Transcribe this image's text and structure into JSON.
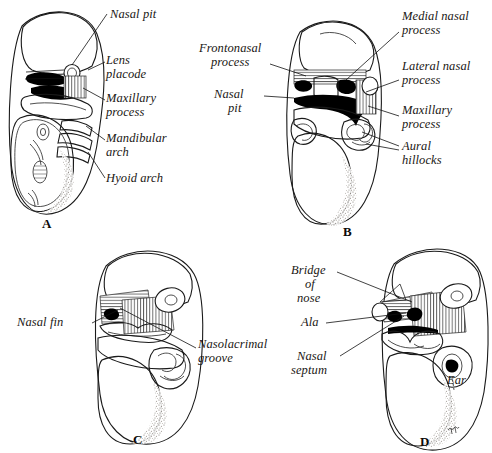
{
  "figure": {
    "panels": [
      {
        "id": "A",
        "letter": "A",
        "labels": [
          {
            "name": "nasal-pit",
            "text": "Nasal pit"
          },
          {
            "name": "lens-placode",
            "text": "Lens\nplacode"
          },
          {
            "name": "maxillary-process",
            "text": "Maxillary\nprocess"
          },
          {
            "name": "mandibular-arch",
            "text": "Mandibular\narch"
          },
          {
            "name": "hyoid-arch",
            "text": "Hyoid arch"
          }
        ]
      },
      {
        "id": "B",
        "letter": "B",
        "labels": [
          {
            "name": "frontonasal-process",
            "text": "Frontonasal\n  process"
          },
          {
            "name": "nasal-pit",
            "text": "Nasal\n  pit"
          },
          {
            "name": "medial-nasal-process",
            "text": "Medial nasal\nprocess"
          },
          {
            "name": "lateral-nasal-process",
            "text": "Lateral nasal\nprocess"
          },
          {
            "name": "maxillary-process",
            "text": "Maxillary\nprocess"
          },
          {
            "name": "aural-hillocks",
            "text": "Aural\nhillocks"
          }
        ]
      },
      {
        "id": "C",
        "letter": "C",
        "labels": [
          {
            "name": "nasal-fin",
            "text": "Nasal fin"
          },
          {
            "name": "nasolacrimal-groove",
            "text": "Nasolacrimal\ngroove"
          }
        ]
      },
      {
        "id": "D",
        "letter": "D",
        "labels": [
          {
            "name": "bridge-of-nose",
            "text": "Bridge\n   of\n nose"
          },
          {
            "name": "ala",
            "text": "Ala"
          },
          {
            "name": "nasal-septum",
            "text": "Nasal\nseptum"
          },
          {
            "name": "ear",
            "text": "Ear"
          }
        ]
      }
    ]
  },
  "labels": {
    "a_nasal_pit": "Nasal pit",
    "a_lens_placode_1": "Lens",
    "a_lens_placode_2": "placode",
    "a_maxillary_1": "Maxillary",
    "a_maxillary_2": "process",
    "a_mandibular_1": "Mandibular",
    "a_mandibular_2": "arch",
    "a_hyoid": "Hyoid arch",
    "a_letter": "A",
    "b_frontonasal_1": "Frontonasal",
    "b_frontonasal_2": "process",
    "b_nasal_1": "Nasal",
    "b_nasal_2": "pit",
    "b_medial_1": "Medial nasal",
    "b_medial_2": "process",
    "b_lateral_1": "Lateral nasal",
    "b_lateral_2": "process",
    "b_maxillary_1": "Maxillary",
    "b_maxillary_2": "process",
    "b_aural_1": "Aural",
    "b_aural_2": "hillocks",
    "b_letter": "B",
    "c_nasal_fin": "Nasal fin",
    "c_nasolacrimal_1": "Nasolacrimal",
    "c_nasolacrimal_2": "groove",
    "c_letter": "C",
    "d_bridge_1": "Bridge",
    "d_bridge_2": "of",
    "d_bridge_3": "nose",
    "d_ala": "Ala",
    "d_septum_1": "Nasal",
    "d_septum_2": "septum",
    "d_ear": "Ear",
    "d_letter": "D",
    "d_signature": "Illy"
  },
  "colors": {
    "ink": "#1a1714",
    "paper": "#ffffff",
    "stipple": "#8d8175"
  }
}
